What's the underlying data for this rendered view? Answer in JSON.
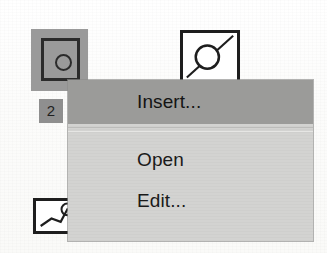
{
  "scene": {
    "description": "Scanned screenshot of a desktop icon view with an open context menu",
    "background_color": "#fdfdfc"
  },
  "icons": [
    {
      "name": "selected-object-icon",
      "label": "2",
      "selected": true,
      "selection_color": "#9a9a9a",
      "glyph": "square-with-circle-icon"
    },
    {
      "name": "document-icon-circle-diagonal",
      "label": "",
      "selected": false,
      "glyph": "document-circle-line-icon"
    },
    {
      "name": "document-icon-polyline",
      "label": "",
      "selected": false,
      "glyph": "document-polyline-icon"
    }
  ],
  "context_menu": {
    "name": "context-menu",
    "background_color": "#d3d3d1",
    "highlight_color": "#9b9b99",
    "items": [
      {
        "label": "Insert...",
        "highlighted": true,
        "separator_after": true
      },
      {
        "label": "Open",
        "highlighted": false,
        "separator_after": false
      },
      {
        "label": "Edit...",
        "highlighted": false,
        "separator_after": false
      }
    ]
  }
}
